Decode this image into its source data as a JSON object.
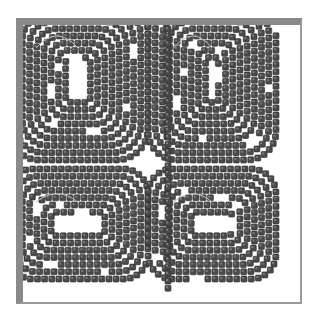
{
  "image": {
    "description": "Scanned artwork of dark grey square beads arranged in four interlocking spiral panels inside a grey frame",
    "frame": {
      "x": 16,
      "y": 18,
      "width": 286,
      "height": 286,
      "thick_border_color": "#8a8a8a",
      "thin_border_color": "#9a9a9a"
    },
    "bead": {
      "size": 6,
      "pitch": 7.2,
      "color": "#4a4a4a",
      "highlight": "#7a7a7a",
      "shadow": "#2a2a2a"
    },
    "background": "#ffffff",
    "panels": [
      {
        "name": "top-left",
        "cx": 78,
        "cy": 80,
        "w": 140,
        "h": 160,
        "rings": 9
      },
      {
        "name": "top-right",
        "cx": 212,
        "cy": 80,
        "w": 128,
        "h": 160,
        "rings": 9
      },
      {
        "name": "bottom-left",
        "cx": 78,
        "cy": 224,
        "w": 140,
        "h": 110,
        "rings": 7
      },
      {
        "name": "bottom-right",
        "cx": 212,
        "cy": 224,
        "w": 128,
        "h": 110,
        "rings": 7
      }
    ]
  }
}
